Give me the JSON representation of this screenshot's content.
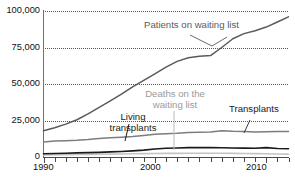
{
  "chart_data": {
    "type": "line",
    "title": "",
    "subtitle": "",
    "xlabel": "",
    "ylabel": "",
    "xlim": [
      1990,
      2012
    ],
    "ylim": [
      0,
      100000
    ],
    "grid": true,
    "legend_position": "inline-annotations",
    "y_ticks": [
      "0",
      "25,000",
      "50,000",
      "75,000",
      "100,000"
    ],
    "y_tick_values": [
      0,
      25000,
      50000,
      75000,
      100000
    ],
    "x_ticks": [
      "1990",
      "2000",
      "2010"
    ],
    "x_tick_values": [
      1990,
      2000,
      2010
    ],
    "x_minor_ticks": [
      1990,
      1991,
      1992,
      1993,
      1994,
      1995,
      1996,
      1997,
      1998,
      1999,
      2000,
      2001,
      2002,
      2003,
      2004,
      2005,
      2006,
      2007,
      2008,
      2009,
      2010,
      2011,
      2012
    ],
    "x": [
      1990,
      1991,
      1992,
      1993,
      1994,
      1995,
      1996,
      1997,
      1998,
      1999,
      2000,
      2001,
      2002,
      2003,
      2004,
      2005,
      2006,
      2007,
      2008,
      2009,
      2010,
      2011,
      2012
    ],
    "series": [
      {
        "name": "Patients on waiting list",
        "color": "#5a5a5a",
        "width": 1.5,
        "values": [
          18000,
          20000,
          22500,
          25500,
          29500,
          34000,
          38500,
          43000,
          48000,
          52500,
          57000,
          61500,
          65500,
          68000,
          69000,
          69500,
          75000,
          81000,
          84500,
          86500,
          89000,
          92500,
          96000
        ]
      },
      {
        "name": "Transplants",
        "color": "#7d7d7d",
        "width": 1.5,
        "values": [
          10300,
          11000,
          11200,
          11500,
          12000,
          12700,
          13100,
          13500,
          14000,
          14800,
          15500,
          16000,
          16200,
          16800,
          17000,
          17200,
          18000,
          17600,
          17400,
          17200,
          17300,
          17400,
          17500
        ]
      },
      {
        "name": "Living transplants",
        "color": "#1a1a1a",
        "width": 1.6,
        "values": [
          2200,
          2400,
          2600,
          2800,
          3000,
          3200,
          3500,
          3800,
          4200,
          4700,
          5500,
          6000,
          6200,
          6400,
          6500,
          6400,
          6300,
          6200,
          6100,
          6000,
          6400,
          5800,
          5600
        ]
      },
      {
        "name": "Deaths on the waiting list",
        "color": "#c4c4c4",
        "width": 1.6,
        "values": [
          1400,
          1500,
          1600,
          1700,
          1800,
          1900,
          2000,
          2100,
          2200,
          2300,
          2400,
          2500,
          2500,
          2600,
          2600,
          2600,
          2600,
          2500,
          2400,
          2300,
          2200,
          2100,
          2000
        ]
      }
    ],
    "annotations": [
      {
        "id": "patients-label",
        "text": "Patients on waiting list",
        "color": "#5a5a5a"
      },
      {
        "id": "transplants-label",
        "text": "Transplants",
        "color": "#1a1a1a"
      },
      {
        "id": "living-transplants-label",
        "text": "Living\ntransplants",
        "line1": "Living",
        "line2": "transplants",
        "color": "#1a1a1a"
      },
      {
        "id": "deaths-label",
        "text": "Deaths on the\nwaiting list",
        "line1": "Deaths on the",
        "line2": "waiting list",
        "color": "#9a9a9a"
      }
    ]
  },
  "axis": {
    "y_labels": [
      "100,000",
      "75,000",
      "50,000",
      "25,000",
      "0"
    ],
    "x_labels": [
      "1990",
      "2000",
      "2010"
    ]
  },
  "annotations": {
    "patients": "Patients on waiting list",
    "transplants": "Transplants",
    "living_line1": "Living",
    "living_line2": "transplants",
    "deaths_line1": "Deaths on the",
    "deaths_line2": "waiting list"
  },
  "colors": {
    "patients": "#5a5a5a",
    "transplants": "#7d7d7d",
    "living": "#1a1a1a",
    "deaths": "#c4c4c4",
    "grid": "#555555",
    "axis": "#4a4a4a"
  }
}
